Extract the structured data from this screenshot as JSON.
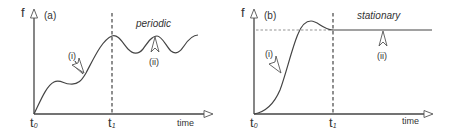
{
  "panels": [
    {
      "id": "a",
      "panel_label": "(a)",
      "y_axis_label": "f",
      "x_axis_label": "time",
      "t0_label": "t",
      "t0_sub": "0",
      "t1_label": "t",
      "t1_sub": "1",
      "regime_label": "periodic",
      "marker_i": "(i)",
      "marker_ii": "(ii)"
    },
    {
      "id": "b",
      "panel_label": "(b)",
      "y_axis_label": "f",
      "x_axis_label": "time",
      "t0_label": "t",
      "t0_sub": "0",
      "t1_label": "t",
      "t1_sub": "1",
      "regime_label": "stationary",
      "marker_i": "(i)",
      "marker_ii": "(ii)"
    }
  ],
  "colors": {
    "line": "#444444",
    "axis": "#444444",
    "background": "#ffffff"
  }
}
